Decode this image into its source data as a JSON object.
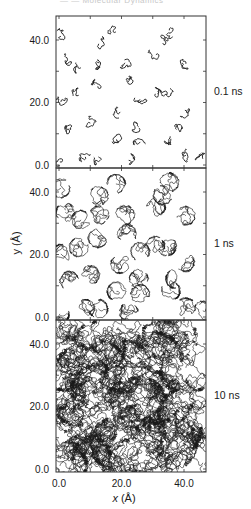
{
  "figure": {
    "header_text": "— — Molecular Dynamics",
    "xlabel_var": "x",
    "xlabel_unit": " (Å)",
    "ylabel_var": "y",
    "ylabel_unit": " (Å)",
    "x_ticks": [
      "0.0",
      "20.0",
      "40.0"
    ],
    "y_ticks": [
      "0.0",
      "20.0",
      "40.0"
    ],
    "line_color": "#1a1a1a",
    "frame_color": "#333333"
  },
  "chart_data": {
    "type": "line",
    "title": "",
    "xlabel": "x (Å)",
    "ylabel": "y (Å)",
    "xlim": [
      -1,
      47
    ],
    "ylim": [
      -1,
      47
    ],
    "x_tick_values": [
      0,
      20,
      40
    ],
    "y_tick_values": [
      0,
      20,
      40
    ],
    "minor_tick_step": 10,
    "grid": false,
    "panels": [
      {
        "label": "0.1 ns",
        "time_ns": 0.1,
        "spread_A": 1.0,
        "steps": 28
      },
      {
        "label": "1 ns",
        "time_ns": 1,
        "spread_A": 3.2,
        "steps": 140
      },
      {
        "label": "10 ns",
        "time_ns": 10,
        "spread_A": 9.0,
        "steps": 620
      }
    ],
    "molecule_start_positions_A": [
      [
        0.6,
        41.2
      ],
      [
        18.2,
        42.6
      ],
      [
        35.3,
        43.1
      ],
      [
        12.7,
        38.8
      ],
      [
        33.2,
        39.0
      ],
      [
        2.0,
        33.5
      ],
      [
        7.0,
        31.1
      ],
      [
        12.9,
        32.7
      ],
      [
        21.1,
        32.7
      ],
      [
        31.0,
        35.3
      ],
      [
        40.6,
        32.4
      ],
      [
        12.4,
        25.2
      ],
      [
        21.8,
        26.6
      ],
      [
        0.6,
        20.2
      ],
      [
        6.3,
        22.3
      ],
      [
        26.0,
        20.9
      ],
      [
        30.8,
        22.8
      ],
      [
        34.5,
        22.6
      ],
      [
        19.6,
        17.0
      ],
      [
        40.3,
        17.5
      ],
      [
        3.3,
        11.6
      ],
      [
        10.0,
        13.4
      ],
      [
        25.5,
        12.2
      ],
      [
        37.1,
        12.2
      ],
      [
        18.4,
        8.2
      ],
      [
        26.0,
        7.4
      ],
      [
        35.8,
        8.4
      ],
      [
        8.4,
        2.6
      ],
      [
        12.6,
        2.6
      ],
      [
        22.3,
        1.5
      ],
      [
        40.6,
        3.1
      ],
      [
        0.3,
        1.0
      ],
      [
        46.0,
        2.0
      ]
    ]
  }
}
